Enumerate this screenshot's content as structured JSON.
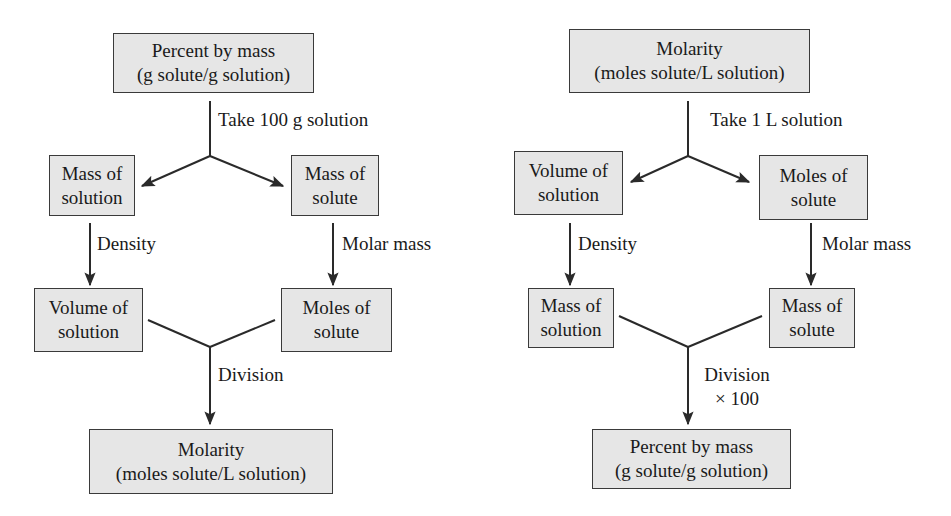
{
  "left_flow": {
    "start": {
      "line1": "Percent by mass",
      "line2": "(g solute/g solution)"
    },
    "split_step": "Take 100 g solution",
    "branch_left": {
      "line1": "Mass of",
      "line2": "solution"
    },
    "branch_right": {
      "line1": "Mass of",
      "line2": "solute"
    },
    "step_left": "Density",
    "step_right": "Molar mass",
    "mid_left": {
      "line1": "Volume of",
      "line2": "solution"
    },
    "mid_right": {
      "line1": "Moles of",
      "line2": "solute"
    },
    "merge_step": "Division",
    "result": {
      "line1": "Molarity",
      "line2": "(moles solute/L solution)"
    }
  },
  "right_flow": {
    "start": {
      "line1": "Molarity",
      "line2": "(moles solute/L solution)"
    },
    "split_step": "Take 1 L solution",
    "branch_left": {
      "line1": "Volume of",
      "line2": "solution"
    },
    "branch_right": {
      "line1": "Moles of",
      "line2": "solute"
    },
    "step_left": "Density",
    "step_right": "Molar mass",
    "mid_left": {
      "line1": "Mass of",
      "line2": "solution"
    },
    "mid_right": {
      "line1": "Mass of",
      "line2": "solute"
    },
    "merge_step": "Division",
    "merge_step_2": "× 100",
    "result": {
      "line1": "Percent by mass",
      "line2": "(g solute/g solution)"
    }
  },
  "colors": {
    "box_fill": "#e6e6e6",
    "box_border": "#3a3a3a",
    "line": "#2a2a2a"
  }
}
